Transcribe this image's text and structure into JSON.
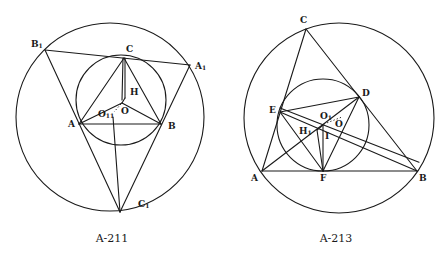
{
  "figures": [
    {
      "id": "A-211",
      "caption": "A-211",
      "labels": {
        "B1": {
          "base": "B",
          "sub": "1"
        },
        "A1": {
          "base": "A",
          "sub": "1"
        },
        "C1": {
          "base": "C",
          "sub": "1"
        },
        "C": "C",
        "A": "A",
        "B": "B",
        "H": "H",
        "O": "O",
        "O11": {
          "base": "O",
          "sub": "11"
        }
      },
      "points": {
        "B1": [
          45,
          50
        ],
        "A1": [
          190,
          65
        ],
        "C1": [
          120,
          212
        ],
        "C": [
          124,
          58
        ],
        "A": [
          79,
          124
        ],
        "B": [
          161,
          124
        ],
        "H": [
          125,
          98
        ],
        "O": [
          122,
          103
        ],
        "O11": [
          114,
          110
        ]
      },
      "circles": [
        {
          "name": "circumcircle-A1B1C1",
          "cx": 110,
          "cy": 117,
          "r": 94
        },
        {
          "name": "circle-ABC",
          "cx": 121,
          "cy": 100,
          "r": 45
        }
      ]
    },
    {
      "id": "A-213",
      "caption": "A-213",
      "labels": {
        "C": "C",
        "A": "A",
        "B": "B",
        "D": "D",
        "E": "E",
        "F": "F",
        "O1": {
          "base": "O",
          "sub": "1"
        },
        "O": "O",
        "H1": {
          "base": "H",
          "sub": "1"
        },
        "I": "I"
      },
      "points": {
        "C": [
          82,
          29
        ],
        "A": [
          38,
          171
        ],
        "B": [
          193,
          171
        ],
        "D": [
          135,
          97
        ],
        "E": [
          56,
          112
        ],
        "F": [
          99,
          171
        ],
        "O1": [
          99,
          125
        ],
        "O": [
          113,
          120
        ],
        "H1": [
          93,
          130
        ]
      },
      "circles": [
        {
          "name": "circumcircle-ABC",
          "cx": 115,
          "cy": 118,
          "r": 95
        },
        {
          "name": "incircle-DEF",
          "cx": 99,
          "cy": 125,
          "r": 46
        }
      ]
    }
  ]
}
